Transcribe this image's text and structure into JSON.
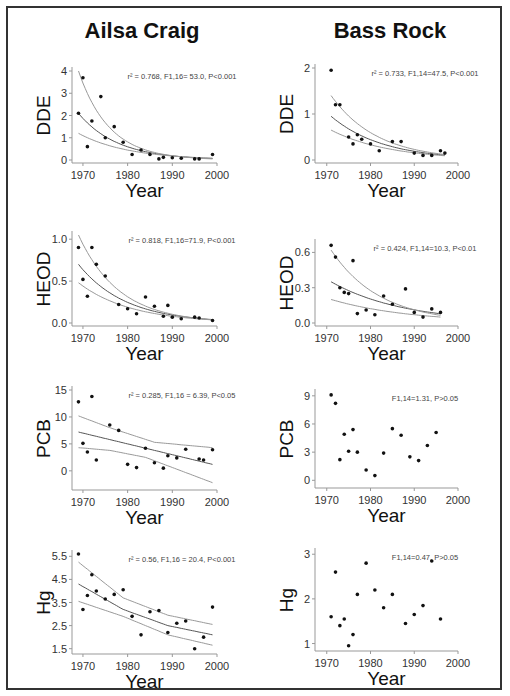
{
  "titles": {
    "left": "Ailsa Craig",
    "right": "Bass Rock"
  },
  "xlabel": "Year",
  "chart_data": [
    {
      "site": "Ailsa Craig",
      "type": "scatter",
      "ylabel": "DDE",
      "title": "",
      "stat": "r² = 0.768, F1,16= 53.0, P<0.001",
      "yticks": [
        0,
        1,
        2,
        3,
        4
      ],
      "ylim": [
        0,
        4
      ],
      "xlim": [
        1968,
        2000
      ],
      "xticks": [
        1970,
        1980,
        1990,
        2000
      ],
      "points": [
        [
          1969,
          2.1
        ],
        [
          1970,
          3.7
        ],
        [
          1971,
          0.6
        ],
        [
          1972,
          1.75
        ],
        [
          1974,
          2.85
        ],
        [
          1975,
          1.0
        ],
        [
          1977,
          1.5
        ],
        [
          1979,
          0.8
        ],
        [
          1981,
          0.25
        ],
        [
          1983,
          0.45
        ],
        [
          1985,
          0.25
        ],
        [
          1987,
          0.05
        ],
        [
          1988,
          0.12
        ],
        [
          1990,
          0.1
        ],
        [
          1992,
          0.08
        ],
        [
          1995,
          0.05
        ],
        [
          1996,
          0.05
        ],
        [
          1999,
          0.25
        ]
      ],
      "fit": {
        "a": 2.1,
        "k": 0.115,
        "x0": 1969,
        "lower": {
          "a": 1.2,
          "k": 0.09
        },
        "upper": {
          "a": 4.0,
          "k": 0.145
        }
      }
    },
    {
      "site": "Bass Rock",
      "type": "scatter",
      "ylabel": "DDE",
      "stat": "r² = 0.733, F1,14=47.5, P<0.001",
      "yticks": [
        0,
        1,
        2
      ],
      "ylim": [
        0,
        2
      ],
      "xlim": [
        1968,
        2000
      ],
      "xticks": [
        1970,
        1980,
        1990,
        2000
      ],
      "points": [
        [
          1971,
          1.95
        ],
        [
          1972,
          1.2
        ],
        [
          1973,
          1.2
        ],
        [
          1975,
          0.5
        ],
        [
          1976,
          0.35
        ],
        [
          1977,
          0.55
        ],
        [
          1978,
          0.45
        ],
        [
          1980,
          0.35
        ],
        [
          1982,
          0.2
        ],
        [
          1985,
          0.4
        ],
        [
          1987,
          0.4
        ],
        [
          1990,
          0.15
        ],
        [
          1992,
          0.1
        ],
        [
          1994,
          0.1
        ],
        [
          1996,
          0.2
        ],
        [
          1997,
          0.15
        ]
      ],
      "fit": {
        "a": 0.95,
        "k": 0.085,
        "x0": 1971,
        "lower": {
          "a": 0.65,
          "k": 0.075
        },
        "upper": {
          "a": 1.4,
          "k": 0.095
        }
      }
    },
    {
      "site": "Ailsa Craig",
      "type": "scatter",
      "ylabel": "HEOD",
      "stat": "r² = 0.818, F1,16=71.9, P<0.001",
      "yticks": [
        0.0,
        0.5,
        1.0
      ],
      "ytick_labels": [
        "0.0",
        "0.5",
        "1.0"
      ],
      "ylim": [
        0,
        1.05
      ],
      "xlim": [
        1968,
        2000
      ],
      "xticks": [
        1970,
        1980,
        1990,
        2000
      ],
      "points": [
        [
          1969,
          0.9
        ],
        [
          1970,
          0.52
        ],
        [
          1971,
          0.32
        ],
        [
          1972,
          0.9
        ],
        [
          1973,
          0.7
        ],
        [
          1975,
          0.56
        ],
        [
          1978,
          0.22
        ],
        [
          1980,
          0.17
        ],
        [
          1982,
          0.11
        ],
        [
          1984,
          0.31
        ],
        [
          1986,
          0.2
        ],
        [
          1988,
          0.08
        ],
        [
          1989,
          0.21
        ],
        [
          1990,
          0.07
        ],
        [
          1992,
          0.05
        ],
        [
          1995,
          0.07
        ],
        [
          1996,
          0.06
        ],
        [
          1999,
          0.03
        ]
      ],
      "fit": {
        "a": 0.7,
        "k": 0.095,
        "x0": 1969,
        "lower": {
          "a": 0.48,
          "k": 0.085
        },
        "upper": {
          "a": 1.05,
          "k": 0.11
        }
      }
    },
    {
      "site": "Bass Rock",
      "type": "scatter",
      "ylabel": "HEOD",
      "stat": "r² = 0.424, F1,14=10.3, P<0.01",
      "yticks": [
        0.0,
        0.3,
        0.6
      ],
      "ytick_labels": [
        "0.0",
        "0.3",
        "0.6"
      ],
      "ylim": [
        0,
        0.68
      ],
      "xlim": [
        1968,
        2000
      ],
      "xticks": [
        1970,
        1980,
        1990,
        2000
      ],
      "points": [
        [
          1971,
          0.66
        ],
        [
          1972,
          0.56
        ],
        [
          1973,
          0.3
        ],
        [
          1974,
          0.26
        ],
        [
          1975,
          0.25
        ],
        [
          1976,
          0.53
        ],
        [
          1977,
          0.08
        ],
        [
          1979,
          0.11
        ],
        [
          1981,
          0.07
        ],
        [
          1983,
          0.23
        ],
        [
          1985,
          0.16
        ],
        [
          1988,
          0.29
        ],
        [
          1990,
          0.09
        ],
        [
          1992,
          0.05
        ],
        [
          1994,
          0.12
        ],
        [
          1996,
          0.09
        ]
      ],
      "fit": {
        "a": 0.35,
        "k": 0.06,
        "x0": 1971,
        "lower": {
          "a": 0.2,
          "k": 0.055
        },
        "upper": {
          "a": 0.62,
          "k": 0.09
        }
      }
    },
    {
      "site": "Ailsa Craig",
      "type": "scatter",
      "ylabel": "PCB",
      "stat": "r² = 0.285, F1,16 = 6.39, P<0.05",
      "yticks": [
        0,
        5,
        10,
        15
      ],
      "ylim": [
        -3,
        15
      ],
      "xlim": [
        1968,
        2000
      ],
      "xticks": [
        1970,
        1980,
        1990,
        2000
      ],
      "points": [
        [
          1969,
          12.8
        ],
        [
          1970,
          5.1
        ],
        [
          1971,
          3.5
        ],
        [
          1972,
          13.8
        ],
        [
          1973,
          2.0
        ],
        [
          1976,
          8.5
        ],
        [
          1978,
          7.5
        ],
        [
          1980,
          1.2
        ],
        [
          1982,
          0.6
        ],
        [
          1984,
          4.2
        ],
        [
          1986,
          1.5
        ],
        [
          1988,
          0.5
        ],
        [
          1989,
          2.8
        ],
        [
          1991,
          2.4
        ],
        [
          1993,
          4.0
        ],
        [
          1996,
          2.2
        ],
        [
          1997,
          2.0
        ],
        [
          1999,
          3.9
        ]
      ],
      "fit": {
        "linear": true,
        "m": -0.2,
        "b0": 7.2,
        "x0": 1969,
        "lower": [
          [
            1969,
            4.3
          ],
          [
            1976,
            3.8
          ],
          [
            1984,
            2.5
          ],
          [
            1999,
            -2.2
          ]
        ],
        "upper": [
          [
            1969,
            10.2
          ],
          [
            1976,
            8.0
          ],
          [
            1986,
            5.3
          ],
          [
            1999,
            4.3
          ]
        ]
      }
    },
    {
      "site": "Bass Rock",
      "type": "scatter",
      "ylabel": "PCB",
      "stat": "F1,14=1.31, P>0.05",
      "yticks": [
        0,
        3,
        6,
        9
      ],
      "ylim": [
        -0.5,
        9.3
      ],
      "xlim": [
        1968,
        2000
      ],
      "xticks": [
        1970,
        1980,
        1990,
        2000
      ],
      "points": [
        [
          1971,
          9.1
        ],
        [
          1972,
          8.2
        ],
        [
          1973,
          2.2
        ],
        [
          1974,
          4.9
        ],
        [
          1975,
          3.1
        ],
        [
          1976,
          5.4
        ],
        [
          1977,
          3.0
        ],
        [
          1979,
          1.1
        ],
        [
          1981,
          0.5
        ],
        [
          1983,
          2.9
        ],
        [
          1985,
          5.5
        ],
        [
          1987,
          4.8
        ],
        [
          1989,
          2.5
        ],
        [
          1991,
          2.1
        ],
        [
          1993,
          3.7
        ],
        [
          1995,
          5.1
        ]
      ]
    },
    {
      "site": "Ailsa Craig",
      "type": "scatter",
      "ylabel": "Hg",
      "stat": "r² = 0.56, F1,16 = 20.4, P<0.001",
      "yticks": [
        1.5,
        2.5,
        3.5,
        4.5,
        5.5
      ],
      "ylim": [
        1.4,
        5.6
      ],
      "xlim": [
        1968,
        2000
      ],
      "xticks": [
        1970,
        1980,
        1990,
        2000
      ],
      "points": [
        [
          1969,
          5.6
        ],
        [
          1970,
          3.2
        ],
        [
          1971,
          3.8
        ],
        [
          1972,
          4.7
        ],
        [
          1973,
          4.0
        ],
        [
          1975,
          3.65
        ],
        [
          1977,
          3.85
        ],
        [
          1979,
          4.05
        ],
        [
          1981,
          2.9
        ],
        [
          1983,
          2.1
        ],
        [
          1985,
          3.1
        ],
        [
          1987,
          3.15
        ],
        [
          1989,
          2.2
        ],
        [
          1991,
          2.6
        ],
        [
          1993,
          2.7
        ],
        [
          1995,
          1.5
        ],
        [
          1997,
          2.0
        ],
        [
          1999,
          3.3
        ]
      ],
      "fit": {
        "linear": false,
        "mid": [
          [
            1969,
            4.3
          ],
          [
            1979,
            3.2
          ],
          [
            1989,
            2.5
          ],
          [
            1999,
            2.1
          ]
        ],
        "lower": [
          [
            1969,
            3.55
          ],
          [
            1979,
            2.9
          ],
          [
            1989,
            2.1
          ],
          [
            1999,
            1.65
          ]
        ],
        "upper": [
          [
            1969,
            5.25
          ],
          [
            1979,
            3.7
          ],
          [
            1989,
            2.95
          ],
          [
            1999,
            2.55
          ]
        ]
      }
    },
    {
      "site": "Bass Rock",
      "type": "scatter",
      "ylabel": "Hg",
      "stat": "F1,14=0.47, P>0.05",
      "yticks": [
        1,
        2,
        3
      ],
      "ylim": [
        0.9,
        3.05
      ],
      "xlim": [
        1968,
        2000
      ],
      "xticks": [
        1970,
        1980,
        1990,
        2000
      ],
      "points": [
        [
          1971,
          1.6
        ],
        [
          1972,
          2.6
        ],
        [
          1973,
          1.4
        ],
        [
          1974,
          1.55
        ],
        [
          1975,
          0.95
        ],
        [
          1976,
          1.2
        ],
        [
          1977,
          2.1
        ],
        [
          1979,
          2.8
        ],
        [
          1981,
          2.2
        ],
        [
          1983,
          1.8
        ],
        [
          1985,
          2.1
        ],
        [
          1988,
          1.45
        ],
        [
          1990,
          1.65
        ],
        [
          1992,
          1.85
        ],
        [
          1994,
          2.85
        ],
        [
          1996,
          1.55
        ]
      ]
    }
  ]
}
